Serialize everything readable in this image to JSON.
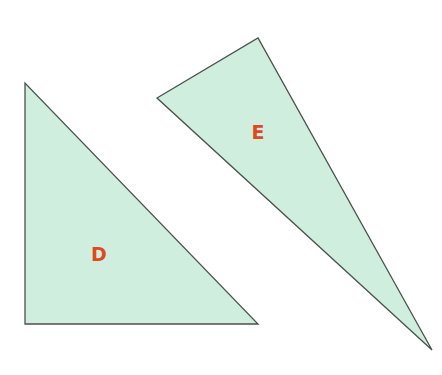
{
  "diagram": {
    "colors": {
      "fill": "#cfeedd",
      "stroke": "#4a524d",
      "label": "#e0481e",
      "background": "#ffffff"
    },
    "shapes": [
      {
        "id": "D",
        "label": "D",
        "type": "right-triangle",
        "points": "25,83 25,324 258,324",
        "label_pos": {
          "x": 99,
          "y": 261
        }
      },
      {
        "id": "E",
        "label": "E",
        "type": "obtuse-triangle",
        "points": "157,98 258,38 432,350",
        "label_pos": {
          "x": 258,
          "y": 139
        }
      }
    ]
  }
}
